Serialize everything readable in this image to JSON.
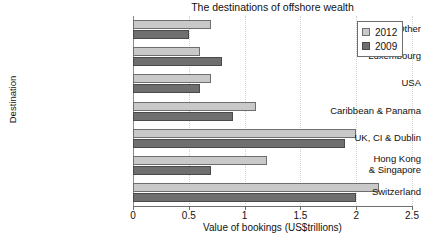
{
  "chart_data": {
    "type": "bar",
    "orientation": "horizontal",
    "title": "The destinations of offshore wealth",
    "xlabel": "Value of bookings (US$trillions)",
    "ylabel": "Destination",
    "xlim": [
      0,
      2.5
    ],
    "xticks": [
      "0",
      "0.5",
      "1",
      "1.5",
      "2",
      "2.5"
    ],
    "xtick_values": [
      0,
      0.5,
      1,
      1.5,
      2,
      2.5
    ],
    "grid": true,
    "grid_axis": "x",
    "legend_position": "top-right",
    "categories": [
      "Other",
      "Luxembourg",
      "USA",
      "Caribbean & Panama",
      "UK, CI & Dublin",
      "Hong Kong\n& Singapore",
      "Switzerland"
    ],
    "series": [
      {
        "name": "2012",
        "color": "#c9c9c9",
        "values": [
          0.7,
          0.6,
          0.7,
          1.1,
          2.0,
          1.2,
          2.2
        ]
      },
      {
        "name": "2009",
        "color": "#6f6f6f",
        "values": [
          0.5,
          0.8,
          0.6,
          0.9,
          1.9,
          0.7,
          2.0
        ]
      }
    ]
  },
  "legend": {
    "items": [
      {
        "label": "2012"
      },
      {
        "label": "2009"
      }
    ]
  }
}
